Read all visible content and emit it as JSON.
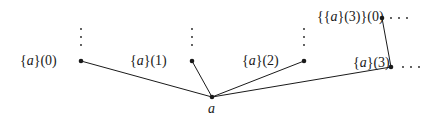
{
  "diagram": {
    "root": {
      "label": "a",
      "x": 212,
      "y": 97
    },
    "nodes": [
      {
        "id": "n0",
        "label_pre": "{",
        "label_var": "a",
        "label_post": "}(0)",
        "x": 81,
        "y": 61
      },
      {
        "id": "n1",
        "label_pre": "{",
        "label_var": "a",
        "label_post": "}(1)",
        "x": 192,
        "y": 61
      },
      {
        "id": "n2",
        "label_pre": "{",
        "label_var": "a",
        "label_post": "}(2)",
        "x": 304,
        "y": 61
      },
      {
        "id": "n3",
        "label_pre": "{",
        "label_var": "a",
        "label_post": "}(3)",
        "x": 391,
        "y": 67
      },
      {
        "id": "n30",
        "label_pre": "{{",
        "label_var": "a",
        "label_post": "}(3)}(0)",
        "x": 382,
        "y": 18
      }
    ],
    "continuation": "· · ·"
  }
}
